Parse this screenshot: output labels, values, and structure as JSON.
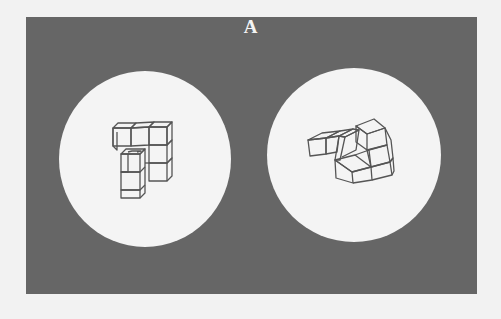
{
  "figure": {
    "label": "A",
    "colors": {
      "page_background": "#f2f2f2",
      "panel": "#666666",
      "circle": "#f4f4f4",
      "stroke": "#555555",
      "label": "#f4f4f4"
    },
    "stimuli": [
      {
        "name": "left-object",
        "circle": {
          "cx": 145,
          "cy": 159,
          "rx": 86,
          "ry": 88
        }
      },
      {
        "name": "right-object",
        "circle": {
          "cx": 354,
          "cy": 155,
          "rx": 87,
          "ry": 87
        }
      }
    ]
  }
}
